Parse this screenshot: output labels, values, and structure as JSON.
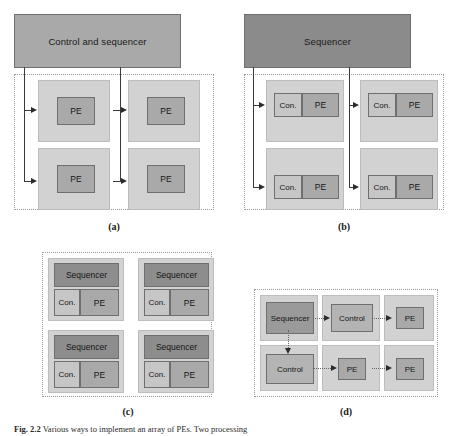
{
  "figure": {
    "caption_bold": "Fig. 2.2",
    "caption_text": "Various ways to implement an array of PEs. Two processing",
    "sublabels": [
      "(a)",
      "(b)",
      "(c)",
      "(d)"
    ]
  },
  "panel_a": {
    "id": "(a)",
    "topbar_label": "Control and sequencer",
    "modules": [
      {
        "pe_label": "PE"
      },
      {
        "pe_label": "PE"
      },
      {
        "pe_label": "PE"
      },
      {
        "pe_label": "PE"
      }
    ]
  },
  "panel_b": {
    "id": "(b)",
    "topbar_label": "Sequencer",
    "modules": [
      {
        "con_label": "Con.",
        "pe_label": "PE"
      },
      {
        "con_label": "Con.",
        "pe_label": "PE"
      },
      {
        "con_label": "Con.",
        "pe_label": "PE"
      },
      {
        "con_label": "Con.",
        "pe_label": "PE"
      }
    ]
  },
  "panel_c": {
    "id": "(c)",
    "cells": [
      {
        "sequencer_label": "Sequencer",
        "con_label": "Con.",
        "pe_label": "PE"
      },
      {
        "sequencer_label": "Sequencer",
        "con_label": "Con.",
        "pe_label": "PE"
      },
      {
        "sequencer_label": "Sequencer",
        "con_label": "Con.",
        "pe_label": "PE"
      },
      {
        "sequencer_label": "Sequencer",
        "con_label": "Con.",
        "pe_label": "PE"
      }
    ]
  },
  "panel_d": {
    "id": "(d)",
    "cells": [
      {
        "label": "Sequencer"
      },
      {
        "label": "Control"
      },
      {
        "label": "PE"
      },
      {
        "label": "Control"
      },
      {
        "label": "PE"
      },
      {
        "label": "PE"
      }
    ]
  },
  "colors": {
    "topbar_light": "#a9a9a9",
    "topbar_dark": "#8b8b8b",
    "module_fill": "#d2d2d2",
    "pe_fill": "#a9a9a9",
    "con_fill": "#c6c6c6",
    "sequencer_fill": "#8d8d8d",
    "control_fill": "#b4b4b4",
    "dotted_border": "#9a9a9a",
    "line": "#3a3a3a"
  }
}
